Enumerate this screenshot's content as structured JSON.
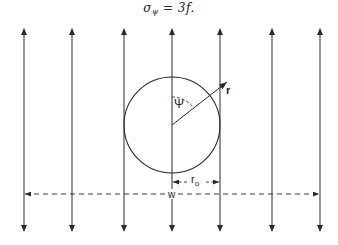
{
  "equation": {
    "lhs": "σ",
    "lhs_subscript": "ψ",
    "operator": " = ",
    "rhs": "3f."
  },
  "diagram": {
    "flux_lines_x": [
      24,
      72,
      124,
      172,
      220,
      272,
      320
    ],
    "flux_line_top": 28,
    "flux_line_bottom": 232,
    "circle": {
      "cx": 172,
      "cy": 125,
      "r": 48
    },
    "labels": {
      "psi": "Ψ",
      "r": "r",
      "r0": "r",
      "r0_subscript": "o",
      "w": "w"
    },
    "colors": {
      "stroke": "#2a2a2a",
      "background": "#ffffff"
    }
  }
}
